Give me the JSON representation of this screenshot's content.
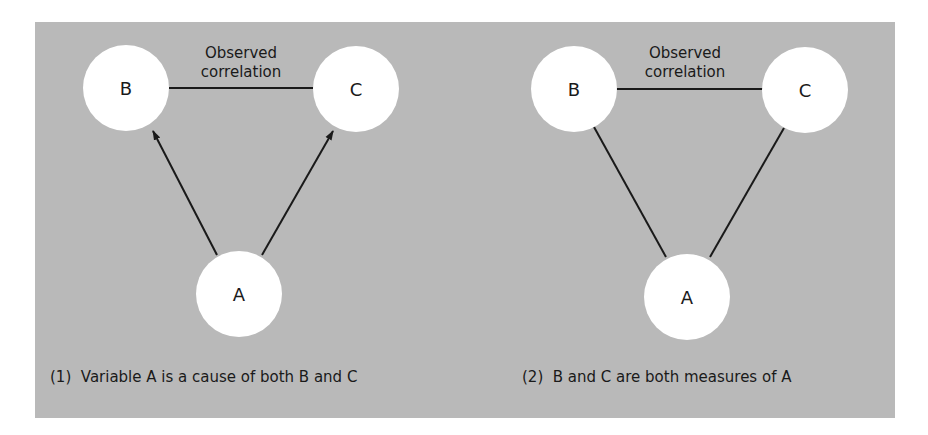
{
  "colors": {
    "background": "#ffffff",
    "panel": "#b9b9b9",
    "node_fill": "#ffffff",
    "line": "#1a1a1a",
    "text": "#1a1a1a"
  },
  "diagrams": [
    {
      "id": "1",
      "caption": "(1)  Variable A is a cause of both B and C",
      "correlation_label_line1": "Observed",
      "correlation_label_line2": "correlation",
      "nodes": [
        {
          "label": "B"
        },
        {
          "label": "C"
        },
        {
          "label": "A"
        }
      ],
      "edges": [
        {
          "from": "B",
          "to": "C",
          "type": "line",
          "meaning": "Observed correlation"
        },
        {
          "from": "A",
          "to": "B",
          "type": "arrow"
        },
        {
          "from": "A",
          "to": "C",
          "type": "arrow"
        }
      ]
    },
    {
      "id": "2",
      "caption": "(2)  B and C are both measures of A",
      "correlation_label_line1": "Observed",
      "correlation_label_line2": "correlation",
      "nodes": [
        {
          "label": "B"
        },
        {
          "label": "C"
        },
        {
          "label": "A"
        }
      ],
      "edges": [
        {
          "from": "B",
          "to": "C",
          "type": "line",
          "meaning": "Observed correlation"
        },
        {
          "from": "A",
          "to": "B",
          "type": "line"
        },
        {
          "from": "A",
          "to": "C",
          "type": "line"
        }
      ]
    }
  ]
}
